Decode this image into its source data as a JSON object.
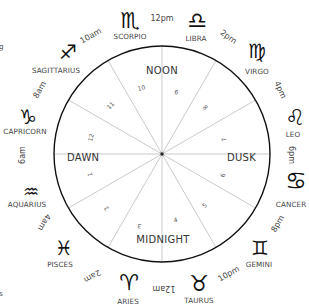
{
  "diagram": {
    "type": "zodiac-clock",
    "center": [
      162,
      154
    ],
    "radius": 108,
    "colors": {
      "circle_stroke": "#111111",
      "spoke_stroke": "#bbbbbb",
      "text": "#444444",
      "glyph": "#111111"
    },
    "quadrants": {
      "top": "NOON",
      "left": "DAWN",
      "right": "DUSK",
      "bottom": "MIDNIGHT"
    },
    "hour_numbers": [
      "10",
      "9",
      "8",
      "7",
      "6",
      "5",
      "4",
      "3",
      "2",
      "1",
      "12",
      "11"
    ],
    "signs": [
      {
        "name": "SCORPIO",
        "glyph": "♏"
      },
      {
        "name": "LIBRA",
        "glyph": "♎"
      },
      {
        "name": "VIRGO",
        "glyph": "♍"
      },
      {
        "name": "LEO",
        "glyph": "♌"
      },
      {
        "name": "CANCER",
        "glyph": "♋"
      },
      {
        "name": "GEMINI",
        "glyph": "♊"
      },
      {
        "name": "TAURUS",
        "glyph": "♉"
      },
      {
        "name": "ARIES",
        "glyph": "♈"
      },
      {
        "name": "PISCES",
        "glyph": "♓"
      },
      {
        "name": "AQUARIUS",
        "glyph": "♒"
      },
      {
        "name": "CAPRICORN",
        "glyph": "♑"
      },
      {
        "name": "SAGITTARIUS",
        "glyph": "♐"
      }
    ],
    "times": [
      "12pm",
      "2pm",
      "4pm",
      "6pm",
      "8pm",
      "10pm",
      "12am",
      "2am",
      "4am",
      "6am",
      "8am",
      "10am"
    ],
    "edge_fragments": [
      "g",
      "s"
    ]
  }
}
